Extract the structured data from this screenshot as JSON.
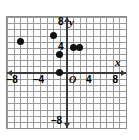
{
  "chart_data": {
    "type": "scatter",
    "title": "",
    "xlabel": "x",
    "ylabel": "y",
    "origin_label": "O",
    "xlim": [
      -9,
      9
    ],
    "ylim": [
      -9,
      9
    ],
    "grid": true,
    "grid_step": 1,
    "legend": "none",
    "x_ticks": [
      -8,
      -4,
      4,
      8
    ],
    "x_tick_labels": [
      "–8",
      "–4",
      "4",
      "8"
    ],
    "y_ticks": [
      8,
      4,
      -8
    ],
    "y_tick_labels": [
      "8",
      "4",
      "–8"
    ],
    "points": [
      {
        "x": -7,
        "y": 5
      },
      {
        "x": -2,
        "y": 6
      },
      {
        "x": -1,
        "y": 3
      },
      {
        "x": -1,
        "y": 0
      },
      {
        "x": 1,
        "y": 4
      },
      {
        "x": 2,
        "y": 4
      }
    ],
    "point_color": "#111111",
    "axis_color": "#3a3a3a",
    "grid_color": "#9a9a9a",
    "background": "#ffffff"
  }
}
